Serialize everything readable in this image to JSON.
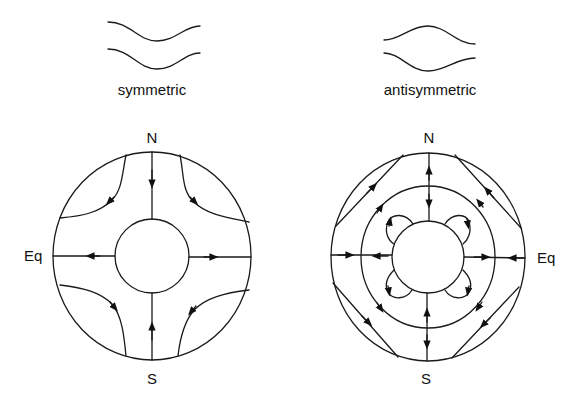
{
  "diagram": {
    "panels": [
      {
        "id": "symmetric",
        "title": "symmetric",
        "labels": {
          "north": "N",
          "south": "S",
          "equator": "Eq"
        },
        "wave_sketch": "two parallel curves dipping downward together",
        "circulation": "flow from poles toward equator; outward radial flow at equator; curved streamlines in four quadrants"
      },
      {
        "id": "antisymmetric",
        "title": "antisymmetric",
        "labels": {
          "north": "N",
          "south": "S",
          "equator": "Eq"
        },
        "wave_sketch": "two curves bulging apart (mirror images)",
        "circulation": "three concentric circles; chords in outer ring; opposing radial arrows; small lobes around inner circle"
      }
    ],
    "colors": {
      "line": "#1a1a1a",
      "background": "#ffffff"
    }
  }
}
